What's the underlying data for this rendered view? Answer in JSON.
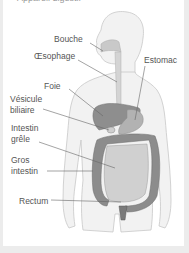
{
  "figure": {
    "heading_clipped": "Appareil digestif",
    "labels": {
      "bouche": "Bouche",
      "oesophage": "Œsophage",
      "estomac": "Estomac",
      "foie": "Foie",
      "vesicule_line1": "Vésicule",
      "vesicule_line2": "biliaire",
      "intestin_grele_line1": "Intestin",
      "intestin_grele_line2": "grêle",
      "gros_intestin_line1": "Gros",
      "gros_intestin_line2": "intestin",
      "rectum": "Rectum"
    },
    "colors": {
      "background": "#ececec",
      "card": "#ffffff",
      "body_fill": "#f1f1f1",
      "body_outline": "#c8c8c8",
      "organ_dark": "#8a8a8a",
      "organ_mid": "#a9a9a9",
      "organ_light": "#c9c9c9",
      "leader_line": "#666666"
    }
  }
}
